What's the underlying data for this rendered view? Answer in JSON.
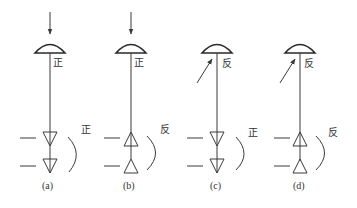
{
  "figure": {
    "panels": [
      {
        "id": "a",
        "caption": "(a)",
        "incidence": "vertical",
        "top_label": "正",
        "side_label": "正",
        "triangles": "down"
      },
      {
        "id": "b",
        "caption": "(b)",
        "incidence": "vertical",
        "top_label": "正",
        "side_label": "反",
        "triangles": "up"
      },
      {
        "id": "c",
        "caption": "(c)",
        "incidence": "oblique",
        "top_label": "反",
        "side_label": "正",
        "triangles": "down"
      },
      {
        "id": "d",
        "caption": "(d)",
        "incidence": "oblique",
        "top_label": "反",
        "side_label": "反",
        "triangles": "up"
      }
    ]
  },
  "colors": {
    "line": "#3a3a3a",
    "background": "#ffffff"
  }
}
